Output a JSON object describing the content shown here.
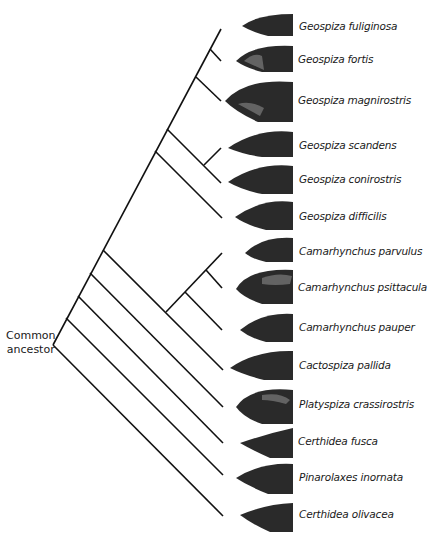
{
  "root_label": [
    "Common",
    "ancestor"
  ],
  "species": [
    {
      "name": "Geospiza fuliginosa",
      "y": 29
    },
    {
      "name": "Geospiza fortis",
      "y": 61
    },
    {
      "name": "Geospiza magnirostris",
      "y": 101
    },
    {
      "name": "Geospiza scandens",
      "y": 148
    },
    {
      "name": "Geospiza conirostris",
      "y": 182
    },
    {
      "name": "Geospiza difficilis",
      "y": 217
    },
    {
      "name": "Camarhynchus parvulus",
      "y": 252
    },
    {
      "name": "Camarhynchus psittacula",
      "y": 289
    },
    {
      "name": "Camarhynchus pauper",
      "y": 330
    },
    {
      "name": "Cactospiza pallida",
      "y": 368
    },
    {
      "name": "Platyspiza crassirostris",
      "y": 407
    },
    {
      "name": "Certhidea fusca",
      "y": 443
    },
    {
      "name": "Pinarolaxes inornata",
      "y": 479
    },
    {
      "name": "Certhidea olivacea",
      "y": 516
    }
  ],
  "colors": {
    "line": "#111111",
    "text": "#1a1a1a",
    "background": "#ffffff"
  }
}
